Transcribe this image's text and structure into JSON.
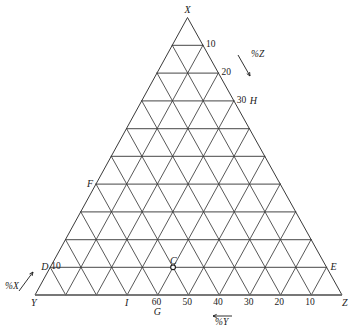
{
  "figure": {
    "type": "ternary-diagram",
    "vertices": [
      {
        "id": "X",
        "label": "X",
        "position": "apex-top"
      },
      {
        "id": "Y",
        "label": "Y",
        "position": "bottom-left"
      },
      {
        "id": "Z",
        "label": "Z",
        "position": "bottom-right"
      }
    ],
    "axis_labels": [
      {
        "id": "pct-x",
        "label": "%X",
        "arrow": "up-right",
        "side": "left"
      },
      {
        "id": "pct-y",
        "label": "%Y",
        "arrow": "left",
        "side": "bottom"
      },
      {
        "id": "pct-z",
        "label": "%Z",
        "arrow": "down-left",
        "side": "right"
      }
    ],
    "right_ticks": [
      {
        "value": "10",
        "level": 1
      },
      {
        "value": "20",
        "level": 2
      },
      {
        "value": "30",
        "level": 3
      }
    ],
    "left_ticks": [
      {
        "value": "10",
        "level": 1
      }
    ],
    "bottom_ticks": [
      {
        "value": "60",
        "index": 4
      },
      {
        "value": "50",
        "index": 5
      },
      {
        "value": "40",
        "index": 6
      },
      {
        "value": "30",
        "index": 7
      },
      {
        "value": "20",
        "index": 8
      },
      {
        "value": "10",
        "index": 9
      }
    ],
    "points": [
      {
        "id": "C",
        "label": "C",
        "marker": "open-circle"
      },
      {
        "id": "D",
        "label": "D",
        "marker": "none"
      },
      {
        "id": "E",
        "label": "E",
        "marker": "none"
      },
      {
        "id": "F",
        "label": "F",
        "marker": "none"
      },
      {
        "id": "G",
        "label": "G",
        "marker": "none"
      },
      {
        "id": "H",
        "label": "H",
        "marker": "none"
      },
      {
        "id": "I",
        "label": "I",
        "marker": "none"
      }
    ],
    "grid": {
      "divisions": 10,
      "line_color": "#3a3a3a",
      "heavy_line_color": "#6b6b6b",
      "background": "#ffffff"
    }
  },
  "chart_data": {
    "type": "table",
    "title": "",
    "xlabel": "%Y",
    "ylabel": "%X",
    "zlabel": "%Z",
    "divisions": 10,
    "axis_min": 0,
    "axis_max": 100,
    "tick_step": 10,
    "corners": {
      "top": "X",
      "left": "Y",
      "right": "Z"
    },
    "grid": true,
    "legend": "none",
    "categories": [
      "C",
      "D",
      "E",
      "F",
      "G",
      "H",
      "I"
    ],
    "series": [
      {
        "name": "%X",
        "values": [
          10,
          10,
          10,
          40,
          0,
          30,
          0
        ]
      },
      {
        "name": "%Y",
        "values": [
          55,
          90,
          0,
          60,
          60,
          0,
          70
        ]
      },
      {
        "name": "%Z",
        "values": [
          35,
          0,
          90,
          0,
          40,
          70,
          30
        ]
      }
    ],
    "annotations": [
      {
        "text": "10",
        "axis": "right"
      },
      {
        "text": "20",
        "axis": "right"
      },
      {
        "text": "30",
        "axis": "right"
      },
      {
        "text": "10",
        "axis": "left"
      },
      {
        "text": "60",
        "axis": "bottom"
      },
      {
        "text": "50",
        "axis": "bottom"
      },
      {
        "text": "40",
        "axis": "bottom"
      },
      {
        "text": "30",
        "axis": "bottom"
      },
      {
        "text": "20",
        "axis": "bottom"
      },
      {
        "text": "10",
        "axis": "bottom"
      }
    ]
  }
}
